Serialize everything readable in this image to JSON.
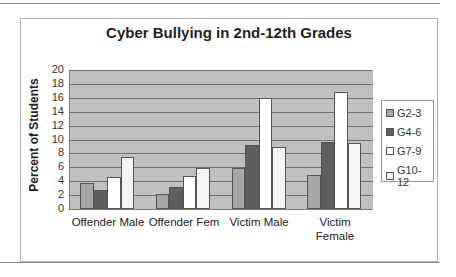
{
  "chart_data": {
    "type": "bar",
    "title": "Cyber Bullying in 2nd-12th Grades",
    "xlabel": "",
    "ylabel": "Percent of Students",
    "ylim": [
      0,
      20
    ],
    "yticks": [
      0,
      2,
      4,
      6,
      8,
      10,
      12,
      14,
      16,
      18,
      20
    ],
    "grid": true,
    "legend_position": "right",
    "categories": [
      "Offender Male",
      "Offender Fem",
      "Victim Male",
      "Victim Female"
    ],
    "series": [
      {
        "name": "G2-3",
        "color": "#a6a6a6",
        "values": [
          3.7,
          2.1,
          5.9,
          4.9
        ]
      },
      {
        "name": "G4-6",
        "color": "#5f5f5f",
        "values": [
          2.7,
          3.1,
          9.2,
          9.6
        ]
      },
      {
        "name": "G7-9",
        "color": "#ffffff",
        "values": [
          4.6,
          4.8,
          16.0,
          16.8
        ]
      },
      {
        "name": "G10-12",
        "color": "#f4f4f4",
        "values": [
          7.5,
          5.9,
          8.9,
          9.5
        ]
      }
    ]
  },
  "labels": {
    "title": "Cyber Bullying in 2nd-12th Grades",
    "ylabel": "Percent of Students",
    "cat0": "Offender Male",
    "cat1": "Offender Fem",
    "cat2a": "Victim Male",
    "cat3a": "Victim",
    "cat3b": "Female",
    "leg0": "G2-3",
    "leg1": "G4-6",
    "leg2": "G7-9",
    "leg3": "G10-12"
  }
}
